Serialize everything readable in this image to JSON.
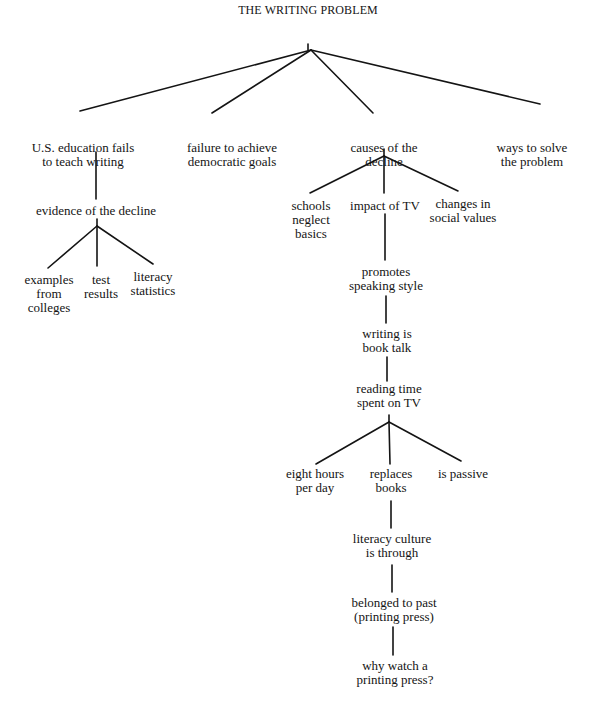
{
  "diagram": {
    "type": "tree",
    "title": "THE WRITING PROBLEM",
    "line_color": "#141414",
    "nodes": [
      {
        "id": "root",
        "lines": [
          "THE WRITING PROBLEM"
        ],
        "x": 308,
        "y": 3
      },
      {
        "id": "us-education",
        "lines": [
          "U.S. education fails",
          "to teach writing"
        ],
        "x": 83,
        "y": 141
      },
      {
        "id": "failure-democratic",
        "lines": [
          "failure to achieve",
          "democratic goals"
        ],
        "x": 232,
        "y": 141
      },
      {
        "id": "causes-decline",
        "lines": [
          "causes of the",
          "decline"
        ],
        "x": 384,
        "y": 141
      },
      {
        "id": "ways-solve",
        "lines": [
          "ways to solve",
          "the problem"
        ],
        "x": 532,
        "y": 141
      },
      {
        "id": "evidence-decline",
        "lines": [
          "evidence of the decline"
        ],
        "x": 96,
        "y": 204
      },
      {
        "id": "examples-colleges",
        "lines": [
          "examples",
          "from",
          "colleges"
        ],
        "x": 49,
        "y": 273
      },
      {
        "id": "test-results",
        "lines": [
          "test",
          "results"
        ],
        "x": 101,
        "y": 273
      },
      {
        "id": "literacy-statistics",
        "lines": [
          "literacy",
          "statistics"
        ],
        "x": 153,
        "y": 270
      },
      {
        "id": "schools-neglect",
        "lines": [
          "schools",
          "neglect",
          "basics"
        ],
        "x": 311,
        "y": 199
      },
      {
        "id": "impact-tv",
        "lines": [
          "impact of TV"
        ],
        "x": 385,
        "y": 199
      },
      {
        "id": "changes-social",
        "lines": [
          "changes in",
          "social values"
        ],
        "x": 463,
        "y": 197
      },
      {
        "id": "promotes-speaking",
        "lines": [
          "promotes",
          "speaking style"
        ],
        "x": 386,
        "y": 265
      },
      {
        "id": "writing-book-talk",
        "lines": [
          "writing is",
          "book talk"
        ],
        "x": 387,
        "y": 327
      },
      {
        "id": "reading-time",
        "lines": [
          "reading time",
          "spent on TV"
        ],
        "x": 389,
        "y": 382
      },
      {
        "id": "eight-hours",
        "lines": [
          "eight hours",
          "per day"
        ],
        "x": 315,
        "y": 467
      },
      {
        "id": "replaces-books",
        "lines": [
          "replaces",
          "books"
        ],
        "x": 391,
        "y": 467
      },
      {
        "id": "is-passive",
        "lines": [
          "is passive"
        ],
        "x": 463,
        "y": 467
      },
      {
        "id": "literacy-culture",
        "lines": [
          "literacy culture",
          "is through"
        ],
        "x": 392,
        "y": 532
      },
      {
        "id": "belonged-past",
        "lines": [
          "belonged to past",
          "(printing press)"
        ],
        "x": 394,
        "y": 596
      },
      {
        "id": "why-watch",
        "lines": [
          "why watch a",
          "printing press?"
        ],
        "x": 395,
        "y": 659
      }
    ],
    "edges": [
      {
        "from": "root",
        "to": "us-education",
        "x1": 311,
        "y1": 50,
        "x2": 80,
        "y2": 111
      },
      {
        "from": "root",
        "to": "failure-democratic",
        "x1": 311,
        "y1": 50,
        "x2": 212,
        "y2": 113
      },
      {
        "from": "root",
        "to": "causes-decline",
        "x1": 311,
        "y1": 50,
        "x2": 373,
        "y2": 113
      },
      {
        "from": "root",
        "to": "ways-solve",
        "x1": 311,
        "y1": 50,
        "x2": 540,
        "y2": 104
      },
      {
        "from": "us-education",
        "to": "evidence-decline",
        "x1": 96,
        "y1": 152,
        "x2": 96,
        "y2": 199
      },
      {
        "from": "evidence-decline",
        "to": "examples-colleges",
        "x1": 97,
        "y1": 226,
        "x2": 48,
        "y2": 268
      },
      {
        "from": "evidence-decline",
        "to": "test-results",
        "x1": 97,
        "y1": 226,
        "x2": 97,
        "y2": 266
      },
      {
        "from": "evidence-decline",
        "to": "literacy-statistics",
        "x1": 97,
        "y1": 226,
        "x2": 153,
        "y2": 264
      },
      {
        "from": "causes-decline",
        "to": "schools-neglect",
        "x1": 384,
        "y1": 156,
        "x2": 310,
        "y2": 193
      },
      {
        "from": "causes-decline",
        "to": "impact-tv",
        "x1": 384,
        "y1": 156,
        "x2": 384,
        "y2": 193
      },
      {
        "from": "causes-decline",
        "to": "changes-social",
        "x1": 384,
        "y1": 156,
        "x2": 458,
        "y2": 191
      },
      {
        "from": "impact-tv",
        "to": "promotes-speaking",
        "x1": 385,
        "y1": 214,
        "x2": 385,
        "y2": 260
      },
      {
        "from": "promotes-speaking",
        "to": "writing-book-talk",
        "x1": 386,
        "y1": 296,
        "x2": 386,
        "y2": 323
      },
      {
        "from": "writing-book-talk",
        "to": "reading-time",
        "x1": 387,
        "y1": 357,
        "x2": 387,
        "y2": 381
      },
      {
        "from": "reading-time",
        "to": "eight-hours",
        "x1": 389,
        "y1": 422,
        "x2": 316,
        "y2": 464
      },
      {
        "from": "reading-time",
        "to": "replaces-books",
        "x1": 389,
        "y1": 422,
        "x2": 390,
        "y2": 464
      },
      {
        "from": "reading-time",
        "to": "is-passive",
        "x1": 389,
        "y1": 422,
        "x2": 461,
        "y2": 461
      },
      {
        "from": "replaces-books",
        "to": "literacy-culture",
        "x1": 391,
        "y1": 501,
        "x2": 391,
        "y2": 528
      },
      {
        "from": "literacy-culture",
        "to": "belonged-past",
        "x1": 392,
        "y1": 565,
        "x2": 392,
        "y2": 592
      },
      {
        "from": "belonged-past",
        "to": "why-watch",
        "x1": 393,
        "y1": 627,
        "x2": 393,
        "y2": 655
      }
    ],
    "stems": [
      {
        "x1": 308,
        "y1": 44,
        "x2": 308,
        "y2": 50
      },
      {
        "x1": 97,
        "y1": 219,
        "x2": 97,
        "y2": 226
      },
      {
        "x1": 384,
        "y1": 149,
        "x2": 384,
        "y2": 156
      },
      {
        "x1": 389,
        "y1": 415,
        "x2": 389,
        "y2": 422
      }
    ]
  }
}
